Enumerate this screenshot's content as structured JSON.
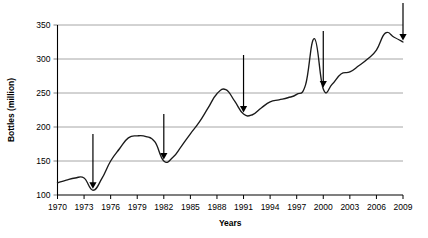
{
  "chart_data": {
    "type": "line",
    "title": "",
    "xlabel": "Years",
    "ylabel": "Bottles (million)",
    "xlim": [
      1970,
      2009
    ],
    "ylim": [
      100,
      350
    ],
    "ytick_step": 50,
    "xtick_step": 3,
    "grid": "horizontal",
    "legend": "none",
    "xtick_labels": [
      "1970",
      "1973",
      "1976",
      "1979",
      "1982",
      "1985",
      "1988",
      "1991",
      "1994",
      "1997",
      "2000",
      "2003",
      "2006",
      "2009"
    ],
    "ytick_labels": [
      "100",
      "150",
      "200",
      "250",
      "300",
      "350"
    ],
    "series": [
      {
        "name": "Bottles",
        "x": [
          1970,
          1971,
          1972,
          1973,
          1974,
          1975,
          1976,
          1977,
          1978,
          1979,
          1980,
          1981,
          1982,
          1983,
          1984,
          1985,
          1986,
          1987,
          1988,
          1989,
          1990,
          1991,
          1992,
          1993,
          1994,
          1995,
          1996,
          1997,
          1998,
          1999,
          2000,
          2001,
          2002,
          2003,
          2004,
          2005,
          2006,
          2007,
          2008,
          2009
        ],
        "values": [
          118,
          122,
          125,
          125,
          107,
          124,
          150,
          168,
          184,
          187,
          186,
          178,
          150,
          155,
          172,
          190,
          207,
          228,
          249,
          255,
          238,
          219,
          218,
          228,
          237,
          240,
          243,
          248,
          262,
          330,
          256,
          263,
          278,
          281,
          290,
          300,
          313,
          338,
          332,
          325
        ]
      }
    ],
    "annotations": [
      {
        "name": "arrow-1974",
        "x": 1974,
        "y": 107,
        "label": ""
      },
      {
        "name": "arrow-1982",
        "x": 1982,
        "y": 150,
        "label": ""
      },
      {
        "name": "arrow-1991",
        "x": 1991,
        "y": 219,
        "label": ""
      },
      {
        "name": "arrow-2000",
        "x": 2000,
        "y": 256,
        "label": ""
      },
      {
        "name": "arrow-2009",
        "x": 2009,
        "y": 325,
        "label": ""
      }
    ],
    "colors": {
      "line": "#1a1a1a",
      "grid": "#a6a6a6",
      "axis": "#000000",
      "arrow": "#000000",
      "background": "#ffffff"
    }
  }
}
